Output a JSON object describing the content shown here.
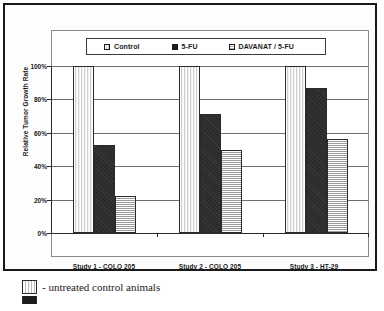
{
  "chart_data": {
    "type": "bar",
    "title": "",
    "subtitle": "",
    "xlabel": "",
    "ylabel": "Relative Tumor Growth Rate",
    "categories": [
      "Study 1 - COLO 205",
      "Study 2 - COLO 205",
      "Study 3 - HT-29"
    ],
    "series": [
      {
        "name": "Control",
        "values": [
          100,
          100,
          100
        ],
        "fill": "vertical-stripes",
        "color": "#e8e8e8"
      },
      {
        "name": "5-FU",
        "values": [
          53,
          71,
          87
        ],
        "fill": "solid-black",
        "color": "#2b2b2b"
      },
      {
        "name": "DAVANAT / 5-FU",
        "values": [
          22,
          50,
          56
        ],
        "fill": "horizontal-stripes",
        "color": "#b5b5b5"
      }
    ],
    "ylim": [
      0,
      100
    ],
    "y_tick_labels": [
      "100%",
      "80%",
      "60%",
      "40%",
      "20%",
      "0%"
    ],
    "y_tick_values": [
      100,
      80,
      60,
      40,
      20,
      0
    ],
    "grid": true,
    "legend_position": "top-inside"
  },
  "legend": {
    "entries": [
      {
        "label": "Control",
        "swatch": "legend-swatch-control"
      },
      {
        "label": "5-FU",
        "swatch": "legend-swatch-5fu"
      },
      {
        "label": "DAVANAT / 5-FU",
        "swatch": "legend-swatch-davanat"
      }
    ]
  },
  "footnotes": [
    {
      "text": "- untreated control animals",
      "swatch": "footnote-swatch-control"
    },
    {
      "text": "",
      "swatch": "footnote-swatch-5fu"
    }
  ]
}
